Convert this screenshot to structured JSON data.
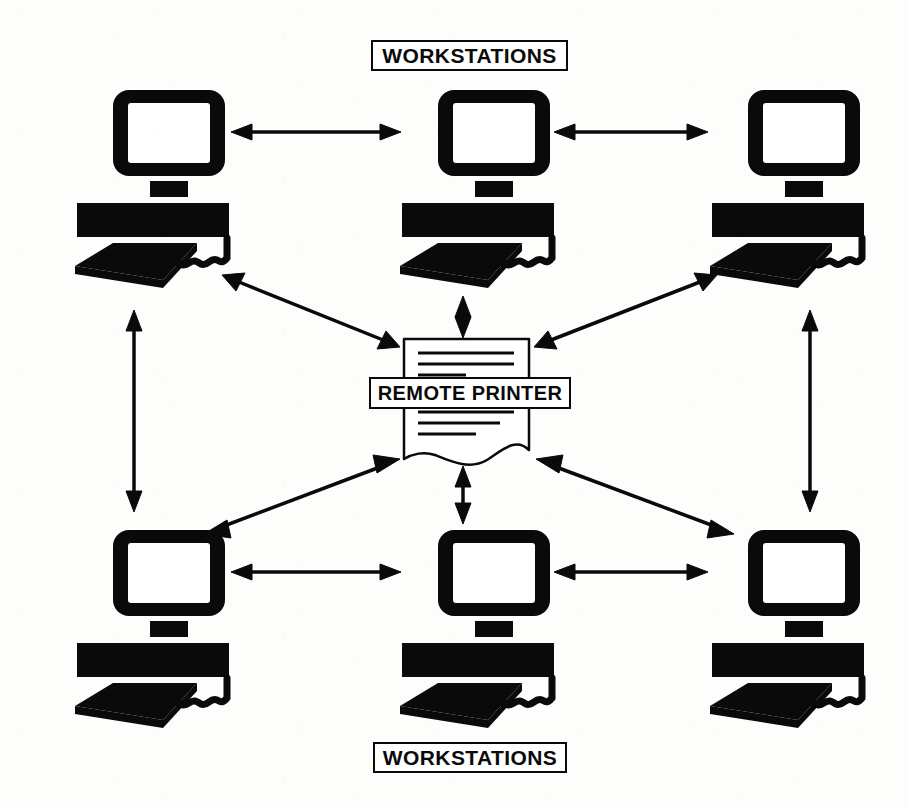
{
  "diagram": {
    "colors": {
      "ink": "#0a0a0a",
      "paper": "#fdfdfc",
      "screen_fill": "#ffffff"
    },
    "labels": {
      "workstations_top": "WORKSTATIONS",
      "workstations_bottom": "WORKSTATIONS",
      "remote_printer": "REMOTE PRINTER"
    },
    "nodes": [
      {
        "id": "ws-top-left",
        "type": "workstation",
        "label": "WORKSTATIONS",
        "row": "top",
        "column": "left",
        "x": 75,
        "y": 88
      },
      {
        "id": "ws-top-center",
        "type": "workstation",
        "label": "WORKSTATIONS",
        "row": "top",
        "column": "center",
        "x": 400,
        "y": 88
      },
      {
        "id": "ws-top-right",
        "type": "workstation",
        "label": "WORKSTATIONS",
        "row": "top",
        "column": "right",
        "x": 710,
        "y": 88
      },
      {
        "id": "ws-bottom-left",
        "type": "workstation",
        "label": "WORKSTATIONS",
        "row": "bottom",
        "column": "left",
        "x": 75,
        "y": 528
      },
      {
        "id": "ws-bottom-center",
        "type": "workstation",
        "label": "WORKSTATIONS",
        "row": "bottom",
        "column": "center",
        "x": 400,
        "y": 528
      },
      {
        "id": "ws-bottom-right",
        "type": "workstation",
        "label": "WORKSTATIONS",
        "row": "bottom",
        "column": "right",
        "x": 710,
        "y": 528
      },
      {
        "id": "remote-printer",
        "type": "printer",
        "label": "REMOTE PRINTER",
        "row": "middle",
        "column": "center",
        "x": 403,
        "y": 338
      }
    ],
    "connections": [
      {
        "from": "ws-top-left",
        "to": "ws-top-center",
        "direction": "bidirectional",
        "orientation": "horizontal"
      },
      {
        "from": "ws-top-center",
        "to": "ws-top-right",
        "direction": "bidirectional",
        "orientation": "horizontal"
      },
      {
        "from": "ws-bottom-left",
        "to": "ws-bottom-center",
        "direction": "bidirectional",
        "orientation": "horizontal"
      },
      {
        "from": "ws-bottom-center",
        "to": "ws-bottom-right",
        "direction": "bidirectional",
        "orientation": "horizontal"
      },
      {
        "from": "ws-top-left",
        "to": "ws-bottom-left",
        "direction": "bidirectional",
        "orientation": "vertical"
      },
      {
        "from": "ws-top-right",
        "to": "ws-bottom-right",
        "direction": "bidirectional",
        "orientation": "vertical"
      },
      {
        "from": "ws-top-left",
        "to": "remote-printer",
        "direction": "bidirectional",
        "orientation": "diagonal"
      },
      {
        "from": "ws-top-right",
        "to": "remote-printer",
        "direction": "bidirectional",
        "orientation": "diagonal"
      },
      {
        "from": "ws-bottom-left",
        "to": "remote-printer",
        "direction": "bidirectional",
        "orientation": "diagonal"
      },
      {
        "from": "ws-bottom-right",
        "to": "remote-printer",
        "direction": "bidirectional",
        "orientation": "diagonal"
      },
      {
        "from": "ws-top-center",
        "to": "remote-printer",
        "direction": "bidirectional",
        "orientation": "vertical"
      },
      {
        "from": "ws-bottom-center",
        "to": "remote-printer",
        "direction": "bidirectional",
        "orientation": "vertical"
      }
    ],
    "printer_document": {
      "text_line_count": 7,
      "bottom_edge": "wavy-torn"
    }
  }
}
